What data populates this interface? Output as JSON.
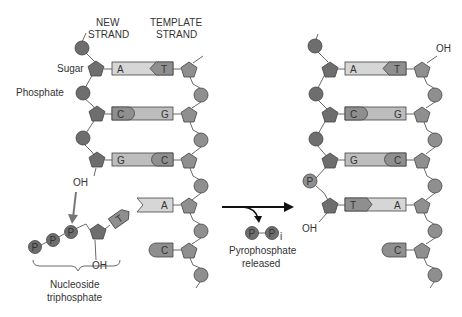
{
  "labels": {
    "new_strand_1": "NEW",
    "new_strand_2": "STRAND",
    "template_strand_1": "TEMPLATE",
    "template_strand_2": "STRAND",
    "sugar": "Sugar",
    "phosphate": "Phosphate",
    "oh_left": "OH",
    "oh_nucleotide": "OH",
    "oh_right_top": "OH",
    "oh_right_bottom": "OH",
    "nucleoside_1": "Nucleoside",
    "nucleoside_2": "triphosphate",
    "pyro_1": "Pyrophosphate",
    "pyro_2": "released",
    "p": "P",
    "pi_sub": "i"
  },
  "before": {
    "pairs": [
      {
        "new": "A",
        "template": "T"
      },
      {
        "new": "C",
        "template": "G"
      },
      {
        "new": "G",
        "template": "C"
      }
    ],
    "incoming": "T",
    "unpaired_template": [
      "A",
      "C"
    ]
  },
  "after": {
    "pairs": [
      {
        "new": "A",
        "template": "T"
      },
      {
        "new": "C",
        "template": "G"
      },
      {
        "new": "G",
        "template": "C"
      },
      {
        "new": "T",
        "template": "A"
      }
    ],
    "unpaired_template": [
      "C"
    ]
  },
  "colors": {
    "dark": "#6e6e6e",
    "medium": "#8f8f8f",
    "light": "#d6d6d6",
    "stroke": "#444444"
  }
}
